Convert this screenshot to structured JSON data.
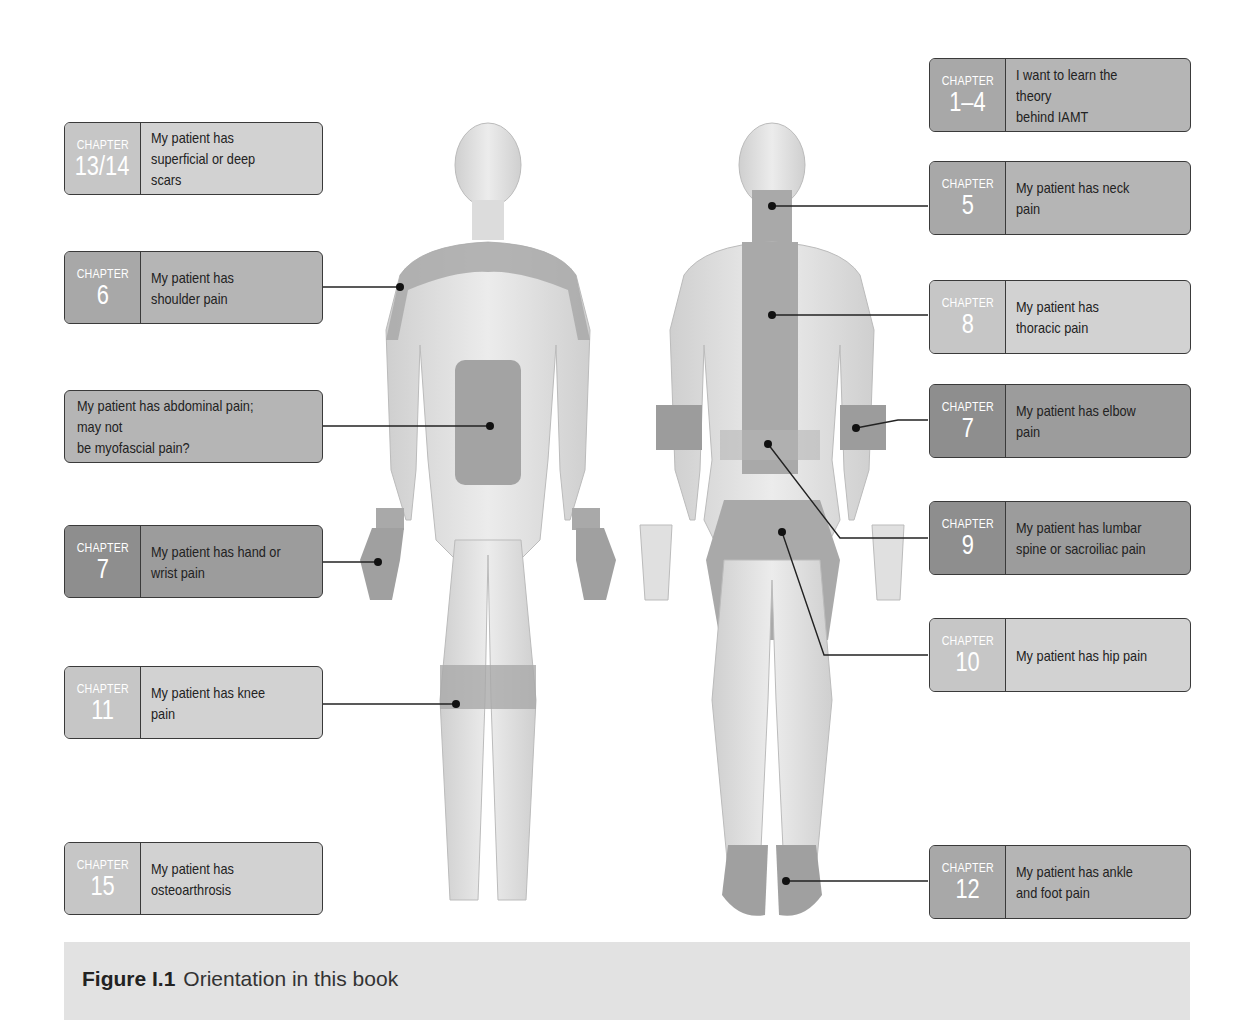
{
  "figure": {
    "caption_label": "Figure I.1",
    "caption_text": "Orientation in this book",
    "chapter_word": "CHAPTER",
    "left_boxes": [
      {
        "chapter": "13/14",
        "text": "My patient has\nsuperficial or deep scars",
        "shade": "light"
      },
      {
        "chapter": "6",
        "text": "My patient has\nshoulder pain",
        "shade": "mid"
      },
      {
        "chapter": "",
        "text": "My patient has abdominal pain; may not\nbe myofascial pain?",
        "shade": "mid"
      },
      {
        "chapter": "7",
        "text": "My patient has hand or\nwrist pain",
        "shade": "dark"
      },
      {
        "chapter": "11",
        "text": "My patient has knee pain",
        "shade": "light"
      },
      {
        "chapter": "15",
        "text": "My patient has\nosteoarthrosis",
        "shade": "light"
      }
    ],
    "right_boxes": [
      {
        "chapter": "1–4",
        "text": "I want to learn the theory\nbehind IAMT",
        "shade": "mid"
      },
      {
        "chapter": "5",
        "text": "My patient has neck pain",
        "shade": "mid"
      },
      {
        "chapter": "8",
        "text": "My patient has\nthoracic pain",
        "shade": "light"
      },
      {
        "chapter": "7",
        "text": "My patient has elbow pain",
        "shade": "dark"
      },
      {
        "chapter": "9",
        "text": "My patient has lumbar\nspine or sacroiliac pain",
        "shade": "dark"
      },
      {
        "chapter": "10",
        "text": "My patient has hip pain",
        "shade": "light"
      },
      {
        "chapter": "12",
        "text": "My patient has ankle\nand foot pain",
        "shade": "mid"
      }
    ],
    "views": [
      "front-view",
      "back-view"
    ],
    "colors": {
      "skin": "#e6e6e6",
      "highlight": "#a9a9a9",
      "line": "#222222"
    }
  }
}
